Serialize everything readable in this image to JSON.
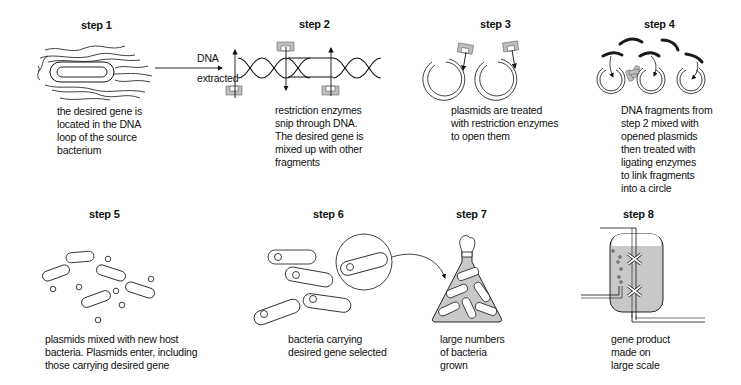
{
  "diagram": {
    "colors": {
      "ink": "#111111",
      "enzyme_gray": "#bdbdbd",
      "liquid_gray": "#c8c8c8",
      "fragment_black": "#1a1a1a"
    },
    "arrow_label": {
      "line1": "DNA",
      "line2": "extracted"
    },
    "steps": [
      {
        "title": "step 1",
        "caption": [
          "the desired gene is",
          "located in the DNA",
          "loop of the source",
          "bacterium"
        ]
      },
      {
        "title": "step 2",
        "caption": [
          "restriction enzymes",
          "snip through DNA.",
          "The desired gene is",
          "mixed up with other",
          "fragments"
        ]
      },
      {
        "title": "step 3",
        "caption": [
          "plasmids are treated",
          "with restriction enzymes",
          "to open them"
        ]
      },
      {
        "title": "step 4",
        "caption": [
          "DNA fragments from",
          "step 2 mixed with",
          "opened plasmids",
          "then treated with",
          "ligating enzymes",
          "to link fragments",
          "into a circle"
        ]
      },
      {
        "title": "step 5",
        "caption": [
          "plasmids mixed with new host",
          "bacteria. Plasmids enter, including",
          "those carrying desired gene"
        ]
      },
      {
        "title": "step 6",
        "caption": [
          "bacteria carrying",
          "desired gene selected"
        ]
      },
      {
        "title": "step 7",
        "caption": [
          "large numbers",
          "of bacteria",
          "grown"
        ]
      },
      {
        "title": "step 8",
        "caption": [
          "gene product",
          "made on",
          "large scale"
        ]
      }
    ]
  }
}
